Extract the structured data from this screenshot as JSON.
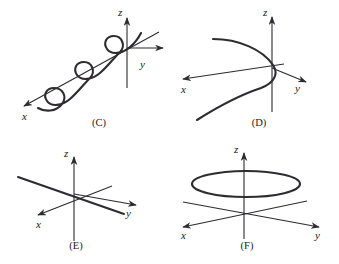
{
  "figure": {
    "background_color": "#ffffff",
    "ink_color": "#2b2b30",
    "width": 339,
    "height": 264
  },
  "panels": [
    {
      "id": "C",
      "caption": "(C)",
      "description": "Helix spiraling around the x-axis with three visible loops",
      "curve_type": "helix-around-x-axis",
      "loop_count": 3,
      "axes": [
        {
          "name": "z",
          "label": "z",
          "label_x": 121,
          "label_y": 13,
          "direction": "up"
        },
        {
          "name": "y",
          "label": "y",
          "label_x": 142,
          "label_y": 66,
          "direction": "right"
        },
        {
          "name": "x",
          "label": "x",
          "label_x": 25,
          "label_y": 118,
          "direction": "lower-left"
        }
      ],
      "origin": {
        "x": 127,
        "y": 48
      }
    },
    {
      "id": "D",
      "caption": "(D)",
      "description": "Parabola opening toward the lower-left in the plane through the origin",
      "curve_type": "parabola",
      "axes": [
        {
          "name": "z",
          "label": "z",
          "label_x": 97,
          "label_y": 13,
          "direction": "up"
        },
        {
          "name": "y",
          "label": "y",
          "label_x": 128,
          "label_y": 88,
          "direction": "right"
        },
        {
          "name": "x",
          "label": "x",
          "label_x": 13,
          "label_y": 90,
          "direction": "left"
        }
      ],
      "origin": {
        "x": 103,
        "y": 68
      }
    },
    {
      "id": "E",
      "caption": "(E)",
      "description": "A straight line through the origin, drawn over the three coordinate axes",
      "curve_type": "straight-line",
      "axes": [
        {
          "name": "z",
          "label": "z",
          "label_x": 66,
          "label_y": 26,
          "direction": "up"
        },
        {
          "name": "y",
          "label": "y",
          "label_x": 128,
          "label_y": 82,
          "direction": "right"
        },
        {
          "name": "x",
          "label": "x",
          "label_x": 38,
          "label_y": 93,
          "direction": "lower-left"
        }
      ],
      "origin": {
        "x": 74,
        "y": 63
      }
    },
    {
      "id": "F",
      "caption": "(F)",
      "description": "Horizontal circle (drawn as an ellipse) lying above the origin, parallel to the xy-plane",
      "curve_type": "circle-horizontal",
      "axes": [
        {
          "name": "z",
          "label": "z",
          "label_x": 67,
          "label_y": 22,
          "direction": "up"
        },
        {
          "name": "y",
          "label": "y",
          "label_x": 148,
          "label_y": 101,
          "direction": "right"
        },
        {
          "name": "x",
          "label": "x",
          "label_x": 13,
          "label_y": 101,
          "direction": "left"
        }
      ],
      "origin": {
        "x": 75,
        "y": 82
      }
    }
  ],
  "captions": {
    "c": "(C)",
    "d": "(D)",
    "e": "(E)",
    "f": "(F)"
  },
  "axis_labels": {
    "x": "x",
    "y": "y",
    "z": "z"
  }
}
